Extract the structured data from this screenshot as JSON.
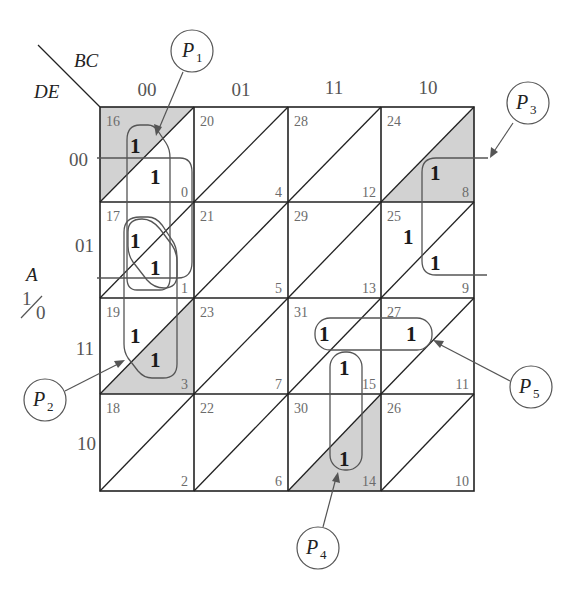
{
  "labels": {
    "col_var": "BC",
    "row_var": "DE",
    "a_var": "A",
    "a_one": "1",
    "a_zero": "0",
    "columns": [
      "00",
      "01",
      "11",
      "10"
    ],
    "rows": [
      "00",
      "01",
      "11",
      "10"
    ]
  },
  "cells": [
    [
      {
        "upper": "16",
        "lower": "0"
      },
      {
        "upper": "20",
        "lower": "4"
      },
      {
        "upper": "28",
        "lower": "12"
      },
      {
        "upper": "24",
        "lower": "8"
      }
    ],
    [
      {
        "upper": "17",
        "lower": "1"
      },
      {
        "upper": "21",
        "lower": "5"
      },
      {
        "upper": "29",
        "lower": "13"
      },
      {
        "upper": "25",
        "lower": "9"
      }
    ],
    [
      {
        "upper": "19",
        "lower": "3"
      },
      {
        "upper": "23",
        "lower": "7"
      },
      {
        "upper": "31",
        "lower": "15"
      },
      {
        "upper": "27",
        "lower": "11"
      }
    ],
    [
      {
        "upper": "18",
        "lower": "2"
      },
      {
        "upper": "22",
        "lower": "6"
      },
      {
        "upper": "30",
        "lower": "14"
      },
      {
        "upper": "26",
        "lower": "10"
      }
    ]
  ],
  "ones": [
    {
      "minterm": "16",
      "value": "1"
    },
    {
      "minterm": "0",
      "value": "1"
    },
    {
      "minterm": "17",
      "value": "1"
    },
    {
      "minterm": "1",
      "value": "1"
    },
    {
      "minterm": "19",
      "value": "1"
    },
    {
      "minterm": "3",
      "value": "1"
    },
    {
      "minterm": "8",
      "value": "1"
    },
    {
      "minterm": "25",
      "value": "1"
    },
    {
      "minterm": "9",
      "value": "1"
    },
    {
      "minterm": "31",
      "value": "1"
    },
    {
      "minterm": "27",
      "value": "1"
    },
    {
      "minterm": "15",
      "value": "1"
    },
    {
      "minterm": "14",
      "value": "1"
    }
  ],
  "shaded_half_cells": [
    "16",
    "3",
    "8",
    "14"
  ],
  "prime_implicants": [
    {
      "name": "P",
      "sub": "1"
    },
    {
      "name": "P",
      "sub": "2"
    },
    {
      "name": "P",
      "sub": "3"
    },
    {
      "name": "P",
      "sub": "4"
    },
    {
      "name": "P",
      "sub": "5"
    }
  ]
}
